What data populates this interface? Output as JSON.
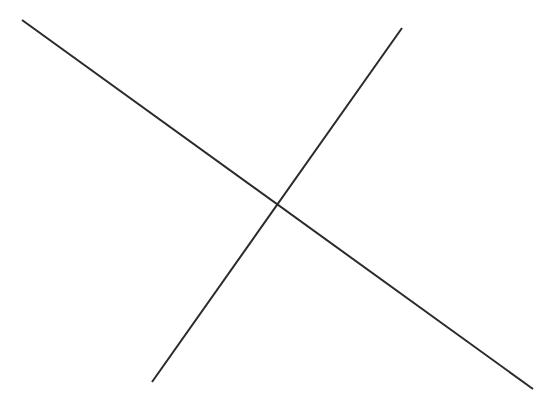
{
  "canvas": {
    "width": 553,
    "height": 410,
    "background_color": "#ffffff",
    "title": "Two intersecting straight lines forming an X"
  },
  "style": {
    "stroke_color": "#2a2a2a",
    "stroke_width": 2
  },
  "chart_data": {
    "type": "line",
    "title": "",
    "subtitle": "",
    "xlabel": "",
    "ylabel": "",
    "grid": false,
    "legend": false,
    "axes_visible": false,
    "tick_labels": [],
    "annotations": [],
    "xlim": [
      0,
      553
    ],
    "ylim": [
      0,
      410
    ],
    "coordinate_note": "Pixel coordinates, origin at top-left of the 553x410 canvas",
    "series": [
      {
        "name": "descending-line",
        "description": "Long line running from upper-left down to lower-right",
        "color": "#2a2a2a",
        "width": 2,
        "x": [
          22,
          533
        ],
        "y": [
          20,
          389
        ],
        "start": {
          "x": 22,
          "y": 20
        },
        "end": {
          "x": 533,
          "y": 389
        },
        "slope": 0.72,
        "length": 629
      },
      {
        "name": "ascending-line",
        "description": "Line running from lower-left up to upper-right",
        "color": "#2a2a2a",
        "width": 2,
        "x": [
          152,
          402
        ],
        "y": [
          382,
          28
        ],
        "start": {
          "x": 152,
          "y": 382
        },
        "end": {
          "x": 402,
          "y": 28
        },
        "slope": -1.42,
        "length": 433
      }
    ],
    "intersections": [
      {
        "name": "crossing-point",
        "x": 275,
        "y": 205
      }
    ]
  }
}
